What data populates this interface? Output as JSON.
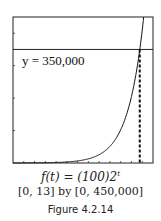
{
  "chart_data": {
    "type": "line",
    "title": "",
    "function_label": "f(t) = (100)2",
    "function_exponent": "t",
    "window_label": "[0, 13] by [0, 450,000]",
    "figure_label": "Figure 4.2.14",
    "xlim": [
      0,
      13
    ],
    "ylim": [
      0,
      450000
    ],
    "xticks_step": 1,
    "yticks_step": 100000,
    "grid": false,
    "series": [
      {
        "name": "f(t) = 100·2^t",
        "x": [
          0,
          1,
          2,
          3,
          4,
          5,
          6,
          7,
          8,
          9,
          10,
          11,
          12,
          12.13
        ],
        "values": [
          100,
          200,
          400,
          800,
          1600,
          3200,
          6400,
          12800,
          25600,
          51200,
          102400,
          204800,
          409600,
          450000
        ]
      }
    ],
    "hline": {
      "y": 350000,
      "label": "y = 350,000"
    },
    "vline": {
      "x": 11.77,
      "style": "dashed"
    }
  }
}
